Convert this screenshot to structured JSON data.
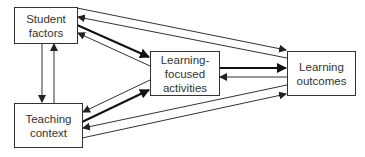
{
  "diagram": {
    "type": "flow",
    "nodes": [
      {
        "id": "student_factors",
        "lines": [
          "Student",
          "factors"
        ]
      },
      {
        "id": "teaching_context",
        "lines": [
          "Teaching",
          "context"
        ]
      },
      {
        "id": "learning_activities",
        "lines": [
          "Learning-",
          "focused",
          "activities"
        ]
      },
      {
        "id": "learning_outcomes",
        "lines": [
          "Learning",
          "outcomes"
        ]
      }
    ],
    "edges": [
      {
        "from": "student_factors",
        "to": "teaching_context",
        "weight": "thin"
      },
      {
        "from": "teaching_context",
        "to": "student_factors",
        "weight": "thin"
      },
      {
        "from": "student_factors",
        "to": "learning_activities",
        "weight": "thick"
      },
      {
        "from": "learning_activities",
        "to": "student_factors",
        "weight": "thin"
      },
      {
        "from": "teaching_context",
        "to": "learning_activities",
        "weight": "thick"
      },
      {
        "from": "learning_activities",
        "to": "teaching_context",
        "weight": "thin"
      },
      {
        "from": "learning_activities",
        "to": "learning_outcomes",
        "weight": "thick"
      },
      {
        "from": "learning_outcomes",
        "to": "learning_activities",
        "weight": "thin"
      },
      {
        "from": "student_factors",
        "to": "learning_outcomes",
        "weight": "thin"
      },
      {
        "from": "learning_outcomes",
        "to": "student_factors",
        "weight": "thin"
      },
      {
        "from": "teaching_context",
        "to": "learning_outcomes",
        "weight": "thin"
      },
      {
        "from": "learning_outcomes",
        "to": "teaching_context",
        "weight": "thin"
      }
    ],
    "colors": {
      "stroke": "#333333",
      "background": "#ffffff",
      "text": "#333333"
    }
  }
}
